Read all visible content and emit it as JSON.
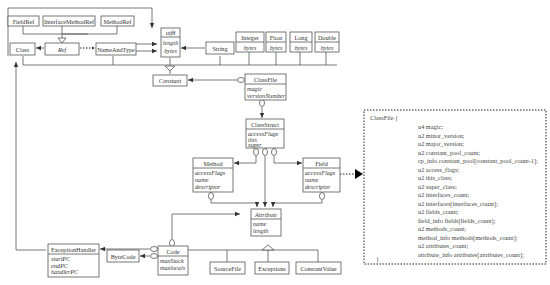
{
  "diagram": {
    "classes": {
      "fieldref": {
        "name": "FieldRef"
      },
      "interfacemethodref": {
        "name": "InterfaceMethodRef"
      },
      "methodref": {
        "name": "MethodRef"
      },
      "utf8": {
        "name": "utf8",
        "attrs": [
          "length",
          "bytes"
        ]
      },
      "class": {
        "name": "Class"
      },
      "ref": {
        "name": "Ref"
      },
      "nameandtype": {
        "name": "NameAndType"
      },
      "string": {
        "name": "String"
      },
      "integer": {
        "name": "Integer",
        "attrs": [
          "bytes"
        ]
      },
      "float": {
        "name": "Float",
        "attrs": [
          "bytes"
        ]
      },
      "long": {
        "name": "Long",
        "attrs": [
          "bytes"
        ]
      },
      "double": {
        "name": "Double",
        "attrs": [
          "bytes"
        ]
      },
      "constant": {
        "name": "Constant"
      },
      "classfile": {
        "name": "ClassFile",
        "attrs": [
          "magic",
          "versionNumber"
        ]
      },
      "classstruct": {
        "name": "ClassStruct",
        "attrs": [
          "accessFlags",
          "this",
          "super"
        ]
      },
      "method": {
        "name": "Method",
        "attrs": [
          "accessFlags",
          "name",
          "descriptor"
        ]
      },
      "field": {
        "name": "Field",
        "attrs": [
          "accessFlags",
          "name",
          "descriptor"
        ]
      },
      "attribute": {
        "name": "Attribute",
        "attrs": [
          "name",
          "length"
        ]
      },
      "exceptionhandler": {
        "name": "ExceptionHandler",
        "attrs": [
          "startPC",
          "endPC",
          "handlerPC"
        ]
      },
      "bytecode": {
        "name": "ByteCode"
      },
      "code": {
        "name": "Code",
        "attrs": [
          "maxStack",
          "maxlocals"
        ]
      },
      "sourcefile": {
        "name": "SourceFile"
      },
      "exceptions": {
        "name": "Exceptions"
      },
      "constantvalue": {
        "name": "ConstantValue"
      }
    },
    "classfile_struct": {
      "header": "ClassFile {",
      "lines": [
        "u4 magic;",
        "u2 minor_version;",
        "u2 major_version;",
        "u2 constant_pool_count;",
        "cp_info constant_pool[constant_pool_count-1];",
        "u2 access_flags;",
        "u2 this_class;",
        "u2 super_class;",
        "u2 interfaces_count;",
        "u2 interfaces[interfaces_count];",
        "u2 fields_count;",
        "field_info fields[fields_count];",
        "u2 methods_count;",
        "method_info methods[methods_count];",
        "u2 attributes_count;",
        "attribute_info attributes[attributes_count];"
      ],
      "footer": "}"
    }
  }
}
